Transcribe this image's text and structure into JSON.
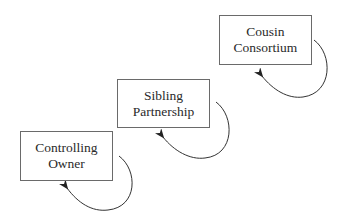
{
  "diagram": {
    "type": "stage-progression",
    "stages": [
      {
        "line1": "Controlling",
        "line2": "Owner"
      },
      {
        "line1": "Sibling",
        "line2": "Partnership"
      },
      {
        "line1": "Cousin",
        "line2": "Consortium"
      }
    ],
    "colors": {
      "stroke": "#6a6a6a",
      "arrow": "#222222",
      "text": "#2a2a2a",
      "background": "#ffffff"
    }
  }
}
